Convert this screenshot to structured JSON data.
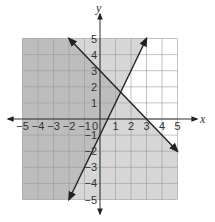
{
  "chart_data": {
    "type": "line",
    "title": "",
    "xlabel": "x",
    "ylabel": "y",
    "xlim": [
      -5,
      5
    ],
    "ylim": [
      -5,
      5
    ],
    "grid": true,
    "x_ticks": [
      "-5",
      "-4",
      "-3",
      "-2",
      "-1",
      "0",
      "1",
      "2",
      "3",
      "4",
      "5"
    ],
    "y_ticks": [
      "5",
      "4",
      "3",
      "2",
      "1",
      "-1",
      "-2",
      "-3",
      "-4",
      "-5"
    ],
    "series": [
      {
        "name": "y = -x + 3",
        "points": [
          [
            -2,
            5
          ],
          [
            5,
            -2
          ]
        ],
        "arrows": "both"
      },
      {
        "name": "y = 2x - 1",
        "points": [
          [
            -2,
            -5
          ],
          [
            3,
            5
          ]
        ],
        "arrows": "both"
      }
    ],
    "shading": [
      {
        "region": "y <= -x + 3",
        "color": "#d4d4d4"
      },
      {
        "region": "y >= 2x - 1",
        "color": "#d4d4d4"
      },
      {
        "region": "overlap",
        "color": "#b8b8b8"
      }
    ],
    "colors": {
      "shade_light": "#d6d6d6",
      "shade_dark": "#bdbdbd",
      "grid": "#9a9a9a",
      "line": "#222222"
    }
  }
}
